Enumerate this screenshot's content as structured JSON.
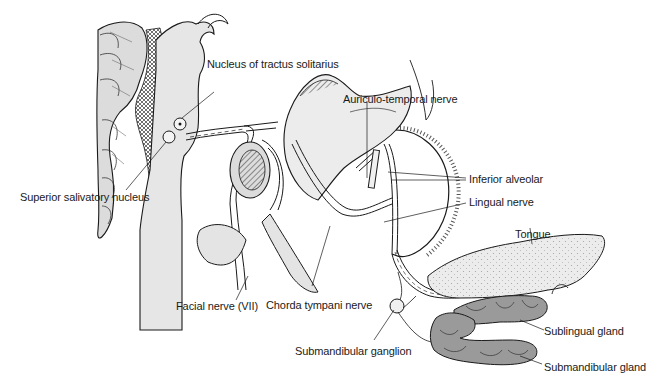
{
  "diagram": {
    "labels": {
      "nucleus_tractus_solitarius": "Nucleus of tractus solitarius",
      "superior_salivatory_nucleus": "Superior salivatory nucleus",
      "auriculo_temporal_nerve": "Auriculo-temporal nerve",
      "inferior_alveolar": "Inferior alveolar",
      "lingual_nerve": "Lingual nerve",
      "tongue": "Tongue",
      "facial_nerve": "Facial nerve (VII)",
      "chorda_tympani_nerve": "Chorda tympani nerve",
      "submandibular_ganglion": "Submandibular ganglion",
      "sublingual_gland": "Sublingual gland",
      "submandibular_gland": "Submandibular gland"
    },
    "colors": {
      "line": "#1a1a1a",
      "shade": "#e4e4e4",
      "gland": "#9a9a9a",
      "tongue": "#e9e9e9",
      "background": "#ffffff"
    }
  }
}
